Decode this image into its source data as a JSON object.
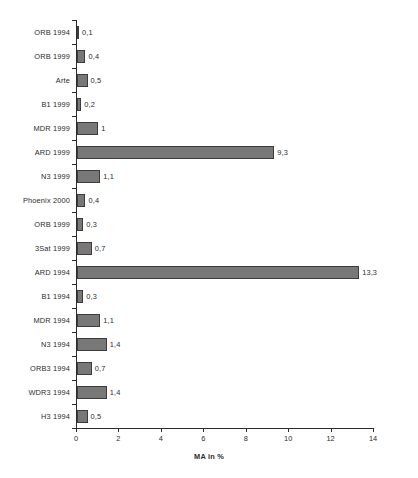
{
  "chart_data": {
    "type": "bar",
    "orientation": "horizontal",
    "title": "",
    "subtitle": "",
    "xlabel": "MA in %",
    "ylabel": "",
    "xlim": [
      0,
      14
    ],
    "xticks": [
      0,
      2,
      4,
      6,
      8,
      10,
      12,
      14
    ],
    "xtick_labels": [
      "0",
      "2",
      "4",
      "6",
      "8",
      "10",
      "12",
      "14"
    ],
    "grid": false,
    "legend": null,
    "bar_color": "#787878",
    "bar_edge_color": "#3c3c3c",
    "axis_color": "#2b2b2b",
    "background_color": "#ffffff",
    "decimal_separator": ",",
    "categories": [
      "ORB 1994",
      "ORB 1999",
      "Arte",
      "B1 1999",
      "MDR 1999",
      "ARD 1999",
      "N3 1999",
      "Phoenix 2000",
      "ORB 1999",
      "3Sat 1999",
      "ARD 1994",
      "B1 1994",
      "MDR 1994",
      "N3 1994",
      "ORB3 1994",
      "WDR3 1994",
      "H3 1994"
    ],
    "values": [
      0.1,
      0.4,
      0.5,
      0.2,
      1,
      9.3,
      1.1,
      0.4,
      0.3,
      0.7,
      13.3,
      0.3,
      1.1,
      1.4,
      0.7,
      1.4,
      0.5
    ],
    "value_labels": [
      "0,1",
      "0,4",
      "0,5",
      "0,2",
      "1",
      "9,3",
      "1,1",
      "0,4",
      "0,3",
      "0,7",
      "13,3",
      "0,3",
      "1,1",
      "1,4",
      "0,7",
      "1,4",
      "0,5"
    ],
    "bars": [
      {
        "label": "ORB 1994",
        "value": 0.1,
        "value_label": "0,1"
      },
      {
        "label": "ORB 1999",
        "value": 0.4,
        "value_label": "0,4"
      },
      {
        "label": "Arte",
        "value": 0.5,
        "value_label": "0,5"
      },
      {
        "label": "B1 1999",
        "value": 0.2,
        "value_label": "0,2"
      },
      {
        "label": "MDR 1999",
        "value": 1,
        "value_label": "1"
      },
      {
        "label": "ARD 1999",
        "value": 9.3,
        "value_label": "9,3"
      },
      {
        "label": "N3 1999",
        "value": 1.1,
        "value_label": "1,1"
      },
      {
        "label": "Phoenix 2000",
        "value": 0.4,
        "value_label": "0,4"
      },
      {
        "label": "ORB 1999",
        "value": 0.3,
        "value_label": "0,3"
      },
      {
        "label": "3Sat 1999",
        "value": 0.7,
        "value_label": "0,7"
      },
      {
        "label": "ARD 1994",
        "value": 13.3,
        "value_label": "13,3"
      },
      {
        "label": "B1 1994",
        "value": 0.3,
        "value_label": "0,3"
      },
      {
        "label": "MDR 1994",
        "value": 1.1,
        "value_label": "1,1"
      },
      {
        "label": "N3 1994",
        "value": 1.4,
        "value_label": "1,4"
      },
      {
        "label": "ORB3 1994",
        "value": 0.7,
        "value_label": "0,7"
      },
      {
        "label": "WDR3 1994",
        "value": 1.4,
        "value_label": "1,4"
      },
      {
        "label": "H3 1994",
        "value": 0.5,
        "value_label": "0,5"
      }
    ]
  }
}
